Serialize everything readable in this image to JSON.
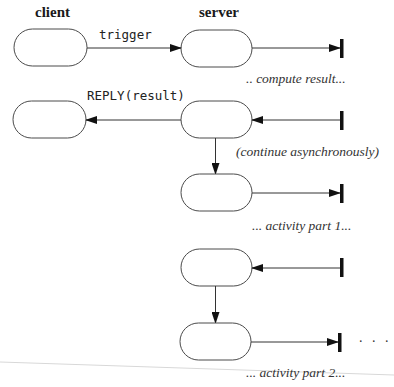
{
  "diagram": {
    "type": "sequence/activity diagram",
    "columns": {
      "client": "client",
      "server": "server"
    },
    "messages": {
      "trigger": "trigger",
      "reply": "REPLY(result)"
    },
    "notes": {
      "compute": ".. compute result...",
      "continue": "(continue asynchronously)",
      "part1": "... activity part 1...",
      "part2": "... activity part 2..."
    },
    "continuation": ". . .",
    "colors": {
      "stroke": "#4a4a4a",
      "fill": "#ffffff",
      "arrow": "#111111",
      "terminal": "#111111",
      "artifact_line": "#d8d8d8"
    },
    "nodes": [
      {
        "id": "client-1",
        "column": "client",
        "x": 14,
        "y": 29,
        "w": 73,
        "h": 37
      },
      {
        "id": "server-1",
        "column": "server",
        "x": 181,
        "y": 30,
        "w": 71,
        "h": 37
      },
      {
        "id": "client-2",
        "column": "client",
        "x": 13,
        "y": 101,
        "w": 73,
        "h": 37
      },
      {
        "id": "server-2",
        "column": "server",
        "x": 181,
        "y": 101,
        "w": 71,
        "h": 37
      },
      {
        "id": "server-3",
        "column": "server",
        "x": 181,
        "y": 174,
        "w": 71,
        "h": 37
      },
      {
        "id": "server-4",
        "column": "server",
        "x": 181,
        "y": 249,
        "w": 71,
        "h": 37
      },
      {
        "id": "server-5",
        "column": "server",
        "x": 180,
        "y": 323,
        "w": 71,
        "h": 37
      }
    ]
  }
}
